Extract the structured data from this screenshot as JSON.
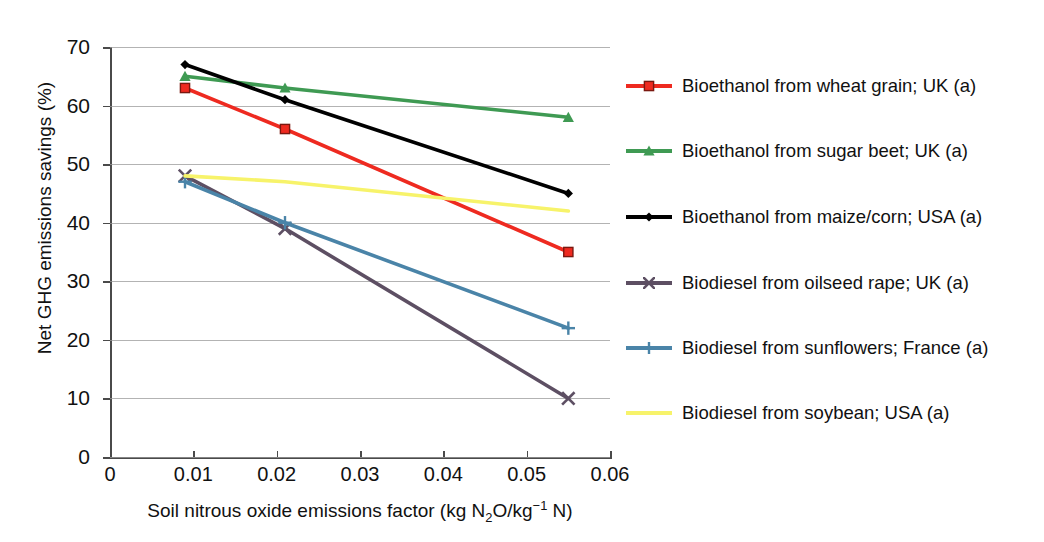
{
  "chart_data": {
    "type": "line",
    "title": "",
    "xlabel": "Soil nitrous oxide emissions factor (kg N2O/kg-1 N)",
    "ylabel": "Net GHG emissions savings (%)",
    "xlim": [
      0,
      0.06
    ],
    "ylim": [
      0,
      70
    ],
    "grid": true,
    "legend_position": "right",
    "x": [
      0.009,
      0.021,
      0.055
    ],
    "xticks": [
      "0",
      "0.01",
      "0.02",
      "0.03",
      "0.04",
      "0.05",
      "0.06"
    ],
    "xtick_values": [
      0,
      0.01,
      0.02,
      0.03,
      0.04,
      0.05,
      0.06
    ],
    "yticks": [
      "0",
      "10",
      "20",
      "30",
      "40",
      "50",
      "60",
      "70"
    ],
    "ytick_values": [
      0,
      10,
      20,
      30,
      40,
      50,
      60,
      70
    ],
    "series": [
      {
        "name": "Bioethanol from wheat grain; UK (a)",
        "color": "#ee2a20",
        "marker": "square",
        "values": [
          63,
          56,
          35
        ]
      },
      {
        "name": "Bioethanol from sugar beet; UK (a)",
        "color": "#3f9a53",
        "marker": "triangle",
        "values": [
          65,
          63,
          58
        ]
      },
      {
        "name": "Bioethanol from maize/corn; USA (a)",
        "color": "#000000",
        "marker": "diamond",
        "values": [
          67,
          61,
          45
        ]
      },
      {
        "name": "Biodiesel from oilseed rape; UK (a)",
        "color": "#5d4f63",
        "marker": "x",
        "values": [
          48,
          39,
          10
        ]
      },
      {
        "name": "Biodiesel from sunflowers; France (a)",
        "color": "#4a84a8",
        "marker": "plus",
        "values": [
          47,
          40,
          22
        ]
      },
      {
        "name": "Biodiesel from soybean; USA (a)",
        "color": "#f7f36a",
        "marker": "line",
        "values": [
          48,
          47,
          42
        ]
      }
    ]
  },
  "axes": {
    "x_title_parts": {
      "before": "Soil nitrous oxide emissions factor (kg N",
      "sub": "2",
      "mid": "O/kg",
      "sup": "−1",
      "after": " N)"
    },
    "y_title": "Net GHG emissions savings (%)"
  },
  "legend": {
    "items": [
      {
        "label": "Bioethanol from wheat grain; UK (a)"
      },
      {
        "label": "Bioethanol from sugar beet; UK (a)"
      },
      {
        "label": "Bioethanol from maize/corn; USA (a)"
      },
      {
        "label": "Biodiesel from oilseed rape; UK (a)"
      },
      {
        "label": "Biodiesel from sunflowers; France (a)"
      },
      {
        "label": "Biodiesel from soybean; USA (a)"
      }
    ]
  }
}
